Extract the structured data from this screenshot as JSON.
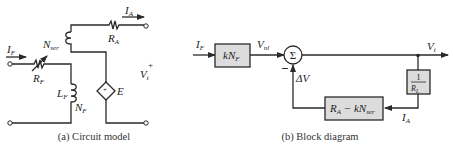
{
  "circuit_model": {
    "caption": "(a) Circuit model",
    "labels": {
      "IF": "I",
      "IF_sub": "F",
      "IA": "I",
      "IA_sub": "A",
      "RA": "R",
      "RA_sub": "A",
      "RF": "R",
      "RF_sub": "F",
      "Nser": "N",
      "Nser_sub": "ser",
      "LF": "L",
      "LF_sub": "F",
      "NF": "N",
      "NF_sub": "F",
      "E": "E",
      "Vt": "V",
      "Vt_sub": "t",
      "plus": "+",
      "source_plus": "+"
    }
  },
  "block_diagram": {
    "caption": "(b) Block diagram",
    "labels": {
      "IF": "I",
      "IF_sub": "F",
      "Vnl": "V",
      "Vnl_sub": "nl",
      "Vt": "V",
      "Vt_sub": "t",
      "IA": "I",
      "IA_sub": "A",
      "minus": "−",
      "deltaV": "ΔV",
      "sigma": "Σ"
    },
    "blocks": {
      "gain": {
        "k": "kN",
        "sub": "F"
      },
      "load": {
        "num": "1",
        "den": "R",
        "den_sub": "L"
      },
      "feedback": {
        "a": "R",
        "a_sub": "A",
        "op": " − kN",
        "b_sub": "ser"
      }
    }
  },
  "colors": {
    "line": "#2a2a2a",
    "block_fill": "#dcdcdc",
    "background": "#ffffff"
  }
}
